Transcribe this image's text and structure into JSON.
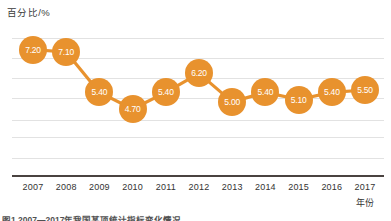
{
  "chart_data": {
    "type": "line",
    "title": "",
    "subtitle": "",
    "ylabel": "百分比/%",
    "xlabel": "年份",
    "categories": [
      "2007",
      "2008",
      "2009",
      "2010",
      "2011",
      "2012",
      "2013",
      "2014",
      "2015",
      "2016",
      "2017"
    ],
    "values": [
      7.2,
      7.1,
      5.4,
      4.7,
      5.4,
      6.2,
      5.0,
      5.4,
      5.1,
      5.4,
      5.5
    ],
    "point_labels": [
      "7.20",
      "7.10",
      "5.40",
      "4.70",
      "5.40",
      "6.20",
      "5.00",
      "5.40",
      "5.10",
      "5.40",
      "5.50"
    ],
    "ylim": [
      3.9,
      7.9
    ],
    "tick_labels_y": [],
    "grid": true,
    "gridlines_count": 7,
    "legend": [],
    "legend_position": "none",
    "series_color": "#e8922e",
    "label_text_color": "#ffffff",
    "gridline_color": "#e2e2e2",
    "axis_color": "#4a4340",
    "background_color": "#ffffff"
  },
  "caption": {
    "cut_off_text": "图1  2007—2017年我国某项统计指标变化情况"
  }
}
